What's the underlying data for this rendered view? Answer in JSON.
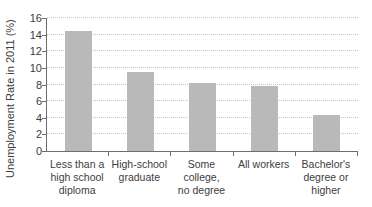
{
  "chart_data": {
    "type": "bar",
    "title": "",
    "xlabel": "",
    "ylabel": "Unemployment Rate in 2011 (%)",
    "categories": [
      "Less than a high school diploma",
      "High-school graduate",
      "Some college, no degree",
      "All workers",
      "Bachelor's degree or higher"
    ],
    "category_lines": [
      [
        "Less than a",
        "high school",
        "diploma"
      ],
      [
        "High-school",
        "graduate"
      ],
      [
        "Some college,",
        "no degree"
      ],
      [
        "All workers"
      ],
      [
        "Bachelor's",
        "degree or",
        "higher"
      ]
    ],
    "values": [
      14.4,
      9.5,
      8.2,
      7.8,
      4.3
    ],
    "ylim": [
      0,
      16
    ],
    "yticks": [
      0,
      2,
      4,
      6,
      8,
      10,
      12,
      14,
      16
    ],
    "grid": "horizontal-dotted",
    "legend_position": "none",
    "colors": {
      "bar": "#b9b9b9",
      "grid": "#c4c4c4",
      "axis": "#6e6e6e",
      "text": "#3d3d3d",
      "background": "#ffffff"
    }
  }
}
